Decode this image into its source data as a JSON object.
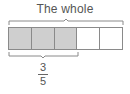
{
  "diagram": {
    "title": "The whole",
    "parts_total": 5,
    "parts_shaded": 3,
    "colors": {
      "shaded": "#cfcfcf",
      "empty": "#ffffff",
      "border": "#8a8a8a",
      "text": "#555555"
    },
    "cells": [
      {
        "state": "shaded"
      },
      {
        "state": "shaded"
      },
      {
        "state": "shaded"
      },
      {
        "state": "empty"
      },
      {
        "state": "empty"
      }
    ],
    "fraction": {
      "numerator": "3",
      "denominator": "5"
    }
  }
}
